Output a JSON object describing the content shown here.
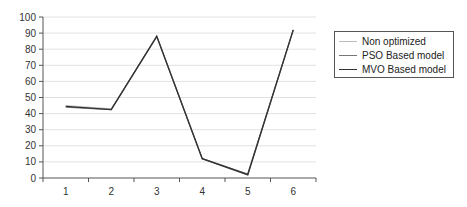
{
  "chart_data": {
    "type": "line",
    "title": "",
    "xlabel": "",
    "ylabel": "",
    "categories": [
      "1",
      "2",
      "3",
      "4",
      "5",
      "6"
    ],
    "ylim": [
      0,
      100
    ],
    "yticks": [
      0,
      10,
      20,
      30,
      40,
      50,
      60,
      70,
      80,
      90,
      100
    ],
    "grid": true,
    "legend_position": "right",
    "series": [
      {
        "name": "Non optimized",
        "values": [
          45,
          43,
          88,
          12,
          2,
          92
        ],
        "color": "#bbbbbb",
        "width": 1
      },
      {
        "name": "PSO Based model",
        "values": [
          44,
          42.5,
          88,
          12,
          2.5,
          92
        ],
        "color": "#777777",
        "width": 1.2
      },
      {
        "name": "MVO Based model",
        "values": [
          44.5,
          42.5,
          88,
          12,
          2,
          92
        ],
        "color": "#333333",
        "width": 1.4
      }
    ]
  },
  "legend": {
    "items": [
      {
        "label": "Non optimized"
      },
      {
        "label": "PSO Based model"
      },
      {
        "label": "MVO Based model"
      }
    ]
  }
}
